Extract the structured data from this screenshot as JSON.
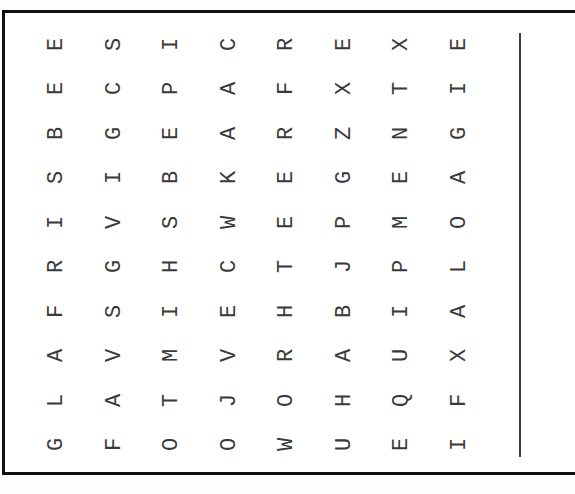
{
  "puzzle": {
    "type": "word-search",
    "rotation_deg": -90,
    "rows": 10,
    "cols": 8,
    "grid": [
      [
        "E",
        "S",
        "I",
        "C",
        "R",
        "E",
        "X",
        "E"
      ],
      [
        "E",
        "C",
        "P",
        "A",
        "F",
        "X",
        "T",
        "I"
      ],
      [
        "B",
        "G",
        "E",
        "A",
        "R",
        "Z",
        "N",
        "G"
      ],
      [
        "S",
        "I",
        "B",
        "K",
        "E",
        "G",
        "E",
        "A"
      ],
      [
        "I",
        "V",
        "S",
        "W",
        "E",
        "P",
        "M",
        "O"
      ],
      [
        "R",
        "G",
        "H",
        "C",
        "T",
        "J",
        "P",
        "L"
      ],
      [
        "F",
        "S",
        "I",
        "E",
        "H",
        "B",
        "I",
        "A"
      ],
      [
        "A",
        "V",
        "M",
        "V",
        "R",
        "A",
        "U",
        "X"
      ],
      [
        "L",
        "A",
        "T",
        "J",
        "O",
        "H",
        "Q",
        "F"
      ],
      [
        "G",
        "F",
        "O",
        "O",
        "W",
        "U",
        "E",
        "I"
      ]
    ]
  },
  "colors": {
    "border": "#111111",
    "letters": "#3a3a3a",
    "divider": "#3c3c3c",
    "background": "#ffffff"
  }
}
